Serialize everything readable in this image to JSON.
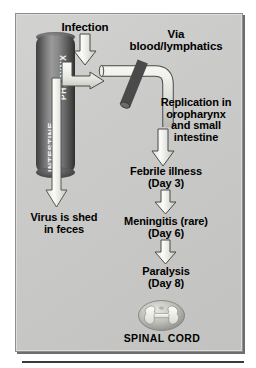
{
  "diagram": {
    "panel": {
      "background_color": "#c9c9c7",
      "border_color": "#8f8f8d"
    },
    "colors": {
      "text": "#000000",
      "arrow_fill": "#f0f0ee",
      "arrow_stroke": "#4a4a4a",
      "cylinder_dark": "#3f3f3f",
      "cylinder_light": "#9a9a9a",
      "cylinder_text": "#f2f2f2",
      "rule": "#3a3a3a"
    },
    "organ": {
      "shape": "cylinder",
      "upper_label": "PHARYNX",
      "lower_label": "INTESTINE"
    },
    "vessel": {
      "name": "blood-vessel-tube",
      "description": "elbow tube with diagonal branch"
    },
    "spinal_cord": {
      "icon": "spinal-cord-cross-section",
      "label": "SPINAL CORD"
    },
    "labels": {
      "infection": "Infection",
      "via_blood_lymphatics": "Via\nblood/lymphatics",
      "replication": "Replication in\noropharynx\nand small\nintestine",
      "febrile": "Febrile illness\n(Day 3)",
      "meningitis": "Meningitis (rare)\n(Day 6)",
      "paralysis": "Paralysis\n(Day 8)",
      "shed": "Virus is shed\nin feces",
      "spinal_cord": "SPINAL CORD"
    },
    "arrows": [
      {
        "name": "infection-arrow",
        "direction": "down",
        "from": "Infection",
        "to": "PHARYNX"
      },
      {
        "name": "pharynx-to-blood-arrow",
        "direction": "curved-right",
        "from": "PHARYNX",
        "to": "blood/lymphatics"
      },
      {
        "name": "replication-arrow",
        "direction": "down",
        "from": "Replication",
        "to": "Febrile illness"
      },
      {
        "name": "febrile-to-meningitis-arrow",
        "direction": "down",
        "from": "Febrile illness (Day 3)",
        "to": "Meningitis (rare) (Day 6)"
      },
      {
        "name": "meningitis-to-paralysis-arrow",
        "direction": "down",
        "from": "Meningitis (rare) (Day 6)",
        "to": "Paralysis (Day 8)"
      },
      {
        "name": "shedding-arrow",
        "direction": "down",
        "from": "INTESTINE",
        "to": "Virus is shed in feces"
      }
    ]
  }
}
